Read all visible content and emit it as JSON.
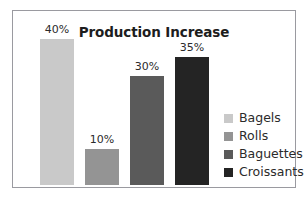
{
  "chart_data": {
    "type": "bar",
    "title": "Production Increase",
    "xlabel": "",
    "ylabel": "",
    "ylim": [
      0,
      40
    ],
    "grid": false,
    "legend_position": "right",
    "categories": [
      "Bagels",
      "Rolls",
      "Baguettes",
      "Croissants"
    ],
    "values": [
      40,
      10,
      30,
      35
    ],
    "value_labels": [
      "40%",
      "10%",
      "30%",
      "35%"
    ],
    "colors": [
      "#c9c9c9",
      "#949494",
      "#5a5a5a",
      "#242424"
    ],
    "series": [
      {
        "name": "Production Increase",
        "values": [
          40,
          10,
          30,
          35
        ]
      }
    ]
  },
  "legend": {
    "items": [
      {
        "label": "Bagels",
        "color": "#c9c9c9"
      },
      {
        "label": "Rolls",
        "color": "#949494"
      },
      {
        "label": "Baguettes",
        "color": "#5a5a5a"
      },
      {
        "label": "Croissants",
        "color": "#242424"
      }
    ]
  }
}
